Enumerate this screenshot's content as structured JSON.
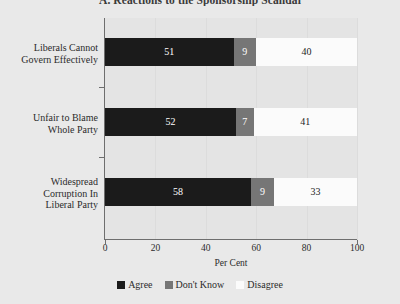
{
  "chart_data": {
    "type": "bar",
    "orientation": "horizontal",
    "stacked": true,
    "title": "A. Reactions to the Sponsorship Scandal",
    "xlabel": "Per Cent",
    "ylabel": "",
    "xlim": [
      0,
      100
    ],
    "xticks": [
      "0",
      "20",
      "40",
      "60",
      "80",
      "100"
    ],
    "xtick_values": [
      0,
      20,
      40,
      60,
      80,
      100
    ],
    "grid": true,
    "grid_axis": "x",
    "legend_position": "bottom-center",
    "categories": [
      "Liberals Cannot Govern Effectively",
      "Unfair to Blame Whole Party",
      "Widespread Corruption In Liberal Party"
    ],
    "category_lines": [
      [
        "Liberals Cannot",
        "Govern Effectively"
      ],
      [
        "Unfair to Blame",
        "Whole Party"
      ],
      [
        "Widespread",
        "Corruption In",
        "Liberal Party"
      ]
    ],
    "series": [
      {
        "name": "Agree",
        "color": "#1b1b1b",
        "values": [
          51,
          52,
          58
        ]
      },
      {
        "name": "Don't Know",
        "color": "#767676",
        "values": [
          9,
          7,
          9
        ]
      },
      {
        "name": "Disagree",
        "color": "#fbfbfb",
        "values": [
          40,
          41,
          33
        ]
      }
    ],
    "bar_labels": [
      [
        "51",
        "9",
        "40"
      ],
      [
        "52",
        "7",
        "41"
      ],
      [
        "58",
        "9",
        "33"
      ]
    ]
  },
  "legend": {
    "items": [
      {
        "label": "Agree"
      },
      {
        "label": "Don't Know"
      },
      {
        "label": "Disagree"
      }
    ]
  }
}
